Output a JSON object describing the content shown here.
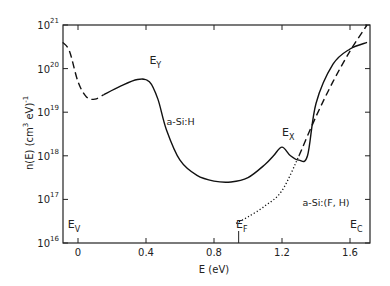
{
  "chart_data": {
    "type": "line",
    "title": "",
    "xlabel": "E (eV)",
    "ylabel": "n(E) (cm3 eV)-1",
    "ylabel_parts": {
      "main": "n(E)  (cm",
      "sup1": "3",
      "mid": " eV)",
      "sup2": "-1"
    },
    "xlim": [
      -0.09,
      1.72
    ],
    "ylim_log10": [
      16,
      21
    ],
    "yscale": "log",
    "grid": false,
    "x_ticks": [
      {
        "value": 0,
        "label": "0"
      },
      {
        "value": 0.4,
        "label": "0.4"
      },
      {
        "value": 0.8,
        "label": "0.8"
      },
      {
        "value": 1.2,
        "label": "1.2"
      },
      {
        "value": 1.6,
        "label": "1.6"
      }
    ],
    "y_ticks": [
      {
        "exp": 16,
        "base": "10",
        "sup": "16"
      },
      {
        "exp": 17,
        "base": "10",
        "sup": "17"
      },
      {
        "exp": 18,
        "base": "10",
        "sup": "18"
      },
      {
        "exp": 19,
        "base": "10",
        "sup": "19"
      },
      {
        "exp": 20,
        "base": "10",
        "sup": "20"
      },
      {
        "exp": 21,
        "base": "10",
        "sup": "21"
      }
    ],
    "series": [
      {
        "name": "a-Si:H (extrapolated, dashed)",
        "style": "dashed",
        "x": [
          -0.09,
          -0.05,
          0.0,
          0.05,
          0.1,
          0.15
        ],
        "log10_y": [
          20.6,
          20.4,
          19.7,
          19.35,
          19.3,
          19.4
        ]
      },
      {
        "name": "a-Si:H",
        "style": "solid",
        "x": [
          0.15,
          0.25,
          0.35,
          0.42,
          0.47,
          0.52,
          0.6,
          0.7,
          0.8,
          0.9,
          1.0,
          1.1,
          1.15,
          1.2,
          1.25,
          1.3,
          1.35,
          1.4,
          1.5,
          1.6,
          1.7
        ],
        "log10_y": [
          19.4,
          19.6,
          19.75,
          19.7,
          19.3,
          18.6,
          17.9,
          17.55,
          17.42,
          17.4,
          17.5,
          17.8,
          18.0,
          18.2,
          18.0,
          17.9,
          18.0,
          19.2,
          20.1,
          20.45,
          20.6
        ]
      },
      {
        "name": "a-Si:(F, H)",
        "style": "dotted",
        "x": [
          0.93,
          1.0,
          1.1,
          1.2,
          1.3
        ],
        "log10_y": [
          16.45,
          16.6,
          16.85,
          17.2,
          18.0
        ]
      },
      {
        "name": "a-Si:(F, H) extrapolated",
        "style": "dashed",
        "x": [
          1.3,
          1.4,
          1.5,
          1.6,
          1.7
        ],
        "log10_y": [
          18.0,
          18.9,
          19.7,
          20.4,
          21.0
        ]
      }
    ],
    "annotations": [
      {
        "text": "E",
        "sub": "Y",
        "x": 0.42,
        "log10_y": 20.1
      },
      {
        "text": "a-Si:H",
        "x": 0.52,
        "log10_y": 18.7
      },
      {
        "text": "E",
        "sub": "X",
        "x": 1.2,
        "log10_y": 18.45
      },
      {
        "text": "a-Si:(F, H)",
        "x": 1.32,
        "log10_y": 16.85
      },
      {
        "text": "E",
        "sub": "V",
        "x": -0.06,
        "log10_y": 16.35
      },
      {
        "text": "E",
        "sub": "F",
        "x": 0.93,
        "log10_y": 16.35
      },
      {
        "text": "E",
        "sub": "C",
        "x": 1.6,
        "log10_y": 16.35
      }
    ],
    "markers": [
      {
        "name": "E_F tick",
        "x": 0.945
      }
    ]
  }
}
